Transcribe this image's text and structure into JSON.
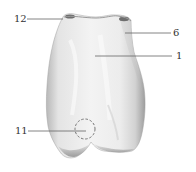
{
  "figure": {
    "colors": {
      "background": "#ffffff",
      "tooth_light": "#f2f2f2",
      "tooth_mid": "#dcdcdc",
      "tooth_shadow": "#a9a9a9",
      "tooth_dark": "#6e6e6e",
      "leader_line": "#555555",
      "label_text": "#333333",
      "marker_circle": "#666666"
    },
    "labels": [
      {
        "id": "label-12",
        "text": "12",
        "x": 14,
        "y": 14,
        "line": {
          "x1": 27,
          "y1": 19,
          "x2": 63,
          "y2": 19
        }
      },
      {
        "id": "label-6",
        "text": "6",
        "x": 173,
        "y": 28,
        "line": {
          "x1": 125,
          "y1": 33,
          "x2": 171,
          "y2": 33
        }
      },
      {
        "id": "label-1",
        "text": "1",
        "x": 176,
        "y": 51,
        "line": {
          "x1": 95,
          "y1": 56,
          "x2": 172,
          "y2": 56
        }
      },
      {
        "id": "label-11",
        "text": "11",
        "x": 15,
        "y": 126,
        "line": {
          "x1": 28,
          "y1": 131,
          "x2": 86,
          "y2": 131
        }
      }
    ],
    "marker": {
      "type": "dashed-circle",
      "cx": 85,
      "cy": 129,
      "r": 10
    }
  }
}
